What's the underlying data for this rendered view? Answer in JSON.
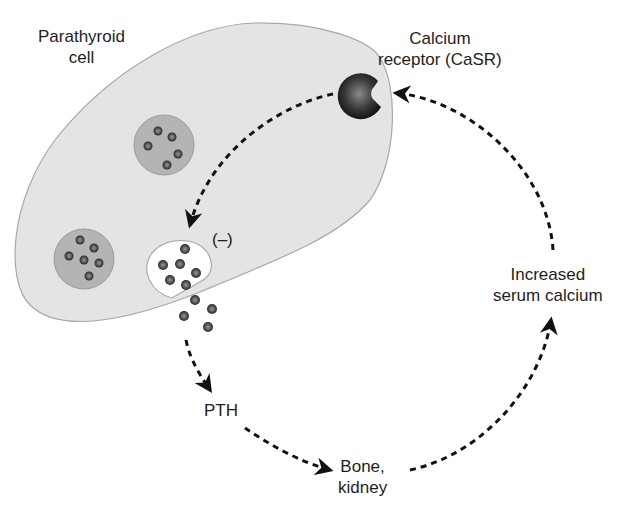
{
  "labels": {
    "cell": [
      "Parathyroid",
      "cell"
    ],
    "receptor": [
      "Calcium",
      "receptor (CaSR)"
    ],
    "inhibition": "(–)",
    "pth": "PTH",
    "target": [
      "Bone,",
      "kidney"
    ],
    "serum": [
      "Increased",
      "serum calcium"
    ]
  },
  "colors": {
    "cell_fill": "#e4e4e4",
    "cell_stroke": "#a8a8a8",
    "vesicle_fill": "#b4b4b4",
    "granule": "#555555",
    "receptor": "#2e2e2e",
    "arrow": "#111111"
  }
}
